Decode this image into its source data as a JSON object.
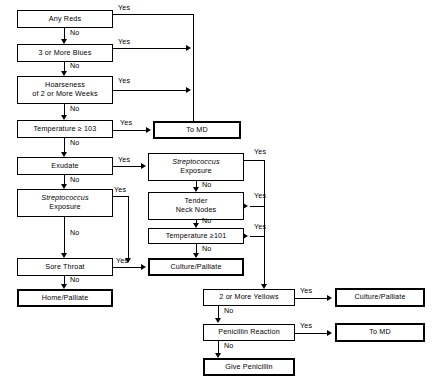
{
  "diagram": {
    "type": "flowchart",
    "yes_label": "Yes",
    "no_label": "No",
    "nodes": [
      {
        "id": "any-reds",
        "text": "Any Reds",
        "kind": "decision"
      },
      {
        "id": "three-blues",
        "text": "3 or More Blues",
        "kind": "decision"
      },
      {
        "id": "hoarseness-l1",
        "text": "Hoarseness",
        "kind": "decision"
      },
      {
        "id": "hoarseness-l2",
        "text": "of 2 or More Weeks",
        "kind": "decision"
      },
      {
        "id": "temperature-103",
        "text": "Temperature ≥ 103",
        "kind": "decision"
      },
      {
        "id": "to-md-top",
        "text": "To MD",
        "kind": "terminal"
      },
      {
        "id": "exudate",
        "text": "Exudate",
        "kind": "decision"
      },
      {
        "id": "strep-left-l1",
        "text": "Streptococcus",
        "kind": "decision"
      },
      {
        "id": "strep-left-l2",
        "text": "Exposure",
        "kind": "decision"
      },
      {
        "id": "sore-throat",
        "text": "Sore Throat",
        "kind": "decision"
      },
      {
        "id": "home-palliate",
        "text": "Home/Palliate",
        "kind": "terminal"
      },
      {
        "id": "strep-right-l1",
        "text": "Streptococcus",
        "kind": "decision"
      },
      {
        "id": "strep-right-l2",
        "text": "Exposure",
        "kind": "decision"
      },
      {
        "id": "tender-nodes-l1",
        "text": "Tender",
        "kind": "decision"
      },
      {
        "id": "tender-nodes-l2",
        "text": "Neck Nodes",
        "kind": "decision"
      },
      {
        "id": "temperature-101",
        "text": "Temperature ≥101",
        "kind": "decision"
      },
      {
        "id": "culture-palliate-mid",
        "text": "Culture/Palliate",
        "kind": "terminal"
      },
      {
        "id": "two-yellows",
        "text": "2 or More Yellows",
        "kind": "decision"
      },
      {
        "id": "culture-palliate-br",
        "text": "Culture/Palliate",
        "kind": "terminal"
      },
      {
        "id": "penicillin-reaction",
        "text": "Penicillin Reaction",
        "kind": "decision"
      },
      {
        "id": "to-md-bottom",
        "text": "To MD",
        "kind": "terminal"
      },
      {
        "id": "give-penicillin",
        "text": "Give Penicillin",
        "kind": "terminal"
      }
    ],
    "edge_labels": {
      "any_reds_yes": "Yes",
      "any_reds_no": "No",
      "three_blues_yes": "Yes",
      "three_blues_no": "No",
      "hoarseness_yes": "Yes",
      "hoarseness_no": "No",
      "temp103_yes": "Yes",
      "temp103_no": "No",
      "exudate_yes": "Yes",
      "exudate_no": "No",
      "strep_left_yes": "Yes",
      "strep_left_no": "No",
      "sore_throat_yes": "Yes",
      "sore_throat_no": "No",
      "strep_right_yes": "Yes",
      "strep_right_no": "No",
      "tender_nodes_yes": "Yes",
      "tender_nodes_no": "No",
      "temp101_yes": "Yes",
      "temp101_no": "No",
      "two_yellows_yes": "Yes",
      "two_yellows_no": "No",
      "penicillin_yes": "Yes",
      "penicillin_no": "No"
    },
    "colors": {
      "background": "#ffffff",
      "stroke": "#000000",
      "text": "#000000"
    }
  }
}
